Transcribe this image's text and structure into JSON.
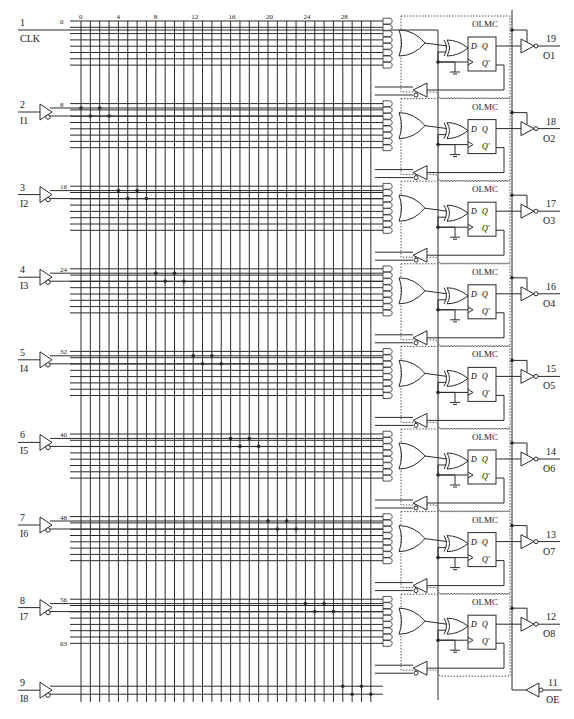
{
  "diagram": {
    "clock": {
      "pin": "1",
      "name": "CLK"
    },
    "column_labels": [
      "0",
      "4",
      "8",
      "12",
      "16",
      "20",
      "24",
      "28"
    ],
    "row_labels": [
      "0",
      "8",
      "16",
      "24",
      "32",
      "40",
      "48",
      "56",
      "63"
    ],
    "inputs": [
      {
        "pin": "2",
        "name": "I1"
      },
      {
        "pin": "3",
        "name": "I2"
      },
      {
        "pin": "4",
        "name": "I3"
      },
      {
        "pin": "5",
        "name": "I4"
      },
      {
        "pin": "6",
        "name": "I5"
      },
      {
        "pin": "7",
        "name": "I6"
      },
      {
        "pin": "8",
        "name": "I7"
      },
      {
        "pin": "9",
        "name": "I8"
      }
    ],
    "outputs": [
      {
        "pin": "19",
        "name": "O1",
        "block": "OLMC"
      },
      {
        "pin": "18",
        "name": "O2",
        "block": "OLMC"
      },
      {
        "pin": "17",
        "name": "O3",
        "block": "OLMC"
      },
      {
        "pin": "16",
        "name": "O4",
        "block": "OLMC"
      },
      {
        "pin": "15",
        "name": "O5",
        "block": "OLMC"
      },
      {
        "pin": "14",
        "name": "O6",
        "block": "OLMC"
      },
      {
        "pin": "13",
        "name": "O7",
        "block": "OLMC"
      },
      {
        "pin": "12",
        "name": "O8",
        "block": "OLMC"
      }
    ],
    "output_enable": {
      "pin": "11",
      "name": "OE"
    },
    "flipflop": {
      "d": "D",
      "q": "Q",
      "qbar": "Q'"
    },
    "colors": {
      "line": "#2a2a2a",
      "dotted": "#555555",
      "background": "#ffffff"
    }
  }
}
